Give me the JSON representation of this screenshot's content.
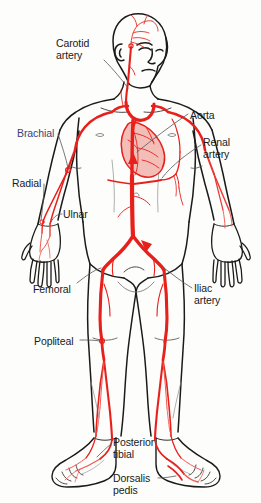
{
  "figure": {
    "background_color": "#fdfdfb",
    "artery_color": "#e8201c",
    "artery_color_light": "#ef5a52",
    "outline_color": "#1a1a1a",
    "leader_line_color": "#55555a",
    "label_color": "#1a1a1a",
    "label_accent_color": "#3a3f7a"
  },
  "labels": [
    {
      "id": "carotid-artery",
      "text": "Carotid\nartery",
      "x": 56,
      "y": 38,
      "color": "default"
    },
    {
      "id": "aorta",
      "text": "Aorta",
      "x": 190,
      "y": 110,
      "color": "default"
    },
    {
      "id": "brachial",
      "text": "Brachial",
      "x": 17,
      "y": 128,
      "color": "blue"
    },
    {
      "id": "renal-artery",
      "text": "Renal\nartery",
      "x": 203,
      "y": 137,
      "color": "default"
    },
    {
      "id": "radial",
      "text": "Radial",
      "x": 12,
      "y": 178,
      "color": "default"
    },
    {
      "id": "ulnar",
      "text": "Ulnar",
      "x": 63,
      "y": 209,
      "color": "default"
    },
    {
      "id": "femoral",
      "text": "Femoral",
      "x": 33,
      "y": 284,
      "color": "default"
    },
    {
      "id": "iliac-artery",
      "text": "Iliac\nartery",
      "x": 194,
      "y": 283,
      "color": "default"
    },
    {
      "id": "popliteal",
      "text": "Popliteal",
      "x": 34,
      "y": 336,
      "color": "default"
    },
    {
      "id": "posterior-tibial",
      "text": "Posterior\ntibial",
      "x": 113,
      "y": 437,
      "color": "default"
    },
    {
      "id": "dorsalis-pedis",
      "text": "Dorsalis\npedis",
      "x": 113,
      "y": 473,
      "color": "default"
    }
  ],
  "arteries": [
    {
      "id": "carotid-artery",
      "name": "Carotid artery",
      "region": "neck-head"
    },
    {
      "id": "aorta",
      "name": "Aorta",
      "region": "thorax-abdomen"
    },
    {
      "id": "brachial",
      "name": "Brachial",
      "region": "upper-arm"
    },
    {
      "id": "renal-artery",
      "name": "Renal artery",
      "region": "abdomen"
    },
    {
      "id": "radial",
      "name": "Radial",
      "region": "forearm-lateral"
    },
    {
      "id": "ulnar",
      "name": "Ulnar",
      "region": "forearm-medial"
    },
    {
      "id": "femoral",
      "name": "Femoral",
      "region": "thigh"
    },
    {
      "id": "iliac-artery",
      "name": "Iliac artery",
      "region": "pelvis"
    },
    {
      "id": "popliteal",
      "name": "Popliteal",
      "region": "knee"
    },
    {
      "id": "posterior-tibial",
      "name": "Posterior tibial",
      "region": "ankle-medial"
    },
    {
      "id": "dorsalis-pedis",
      "name": "Dorsalis pedis",
      "region": "foot-dorsum"
    }
  ]
}
